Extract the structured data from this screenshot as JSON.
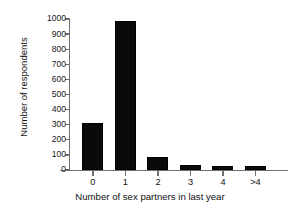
{
  "chart_data": {
    "type": "bar",
    "title": "",
    "xlabel": "Number of sex partners in last year",
    "ylabel": "Number of respondents",
    "categories": [
      "0",
      "1",
      "2",
      "3",
      "4",
      ">4"
    ],
    "values": [
      311,
      990,
      86,
      31,
      24,
      24
    ],
    "ylim": [
      0,
      1000
    ],
    "yticks": [
      0,
      100,
      200,
      300,
      400,
      500,
      600,
      700,
      800,
      900,
      1000
    ],
    "ytick_labels": [
      "0",
      "100",
      "200",
      "300",
      "400",
      "500",
      "600",
      "700",
      "800",
      "900",
      "1000"
    ],
    "grid": false,
    "legend": null,
    "bar_color": "#0a0a0a",
    "axis_color": "#6f6f6f",
    "text_color": "#111111"
  }
}
